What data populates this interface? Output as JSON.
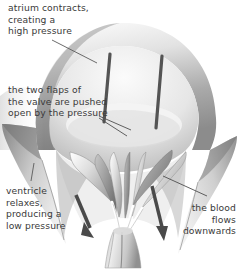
{
  "figure": {
    "style": "grayscale anatomical illustration",
    "width": 239,
    "height": 270,
    "background_color": "#ffffff",
    "text_color": "#3a3a3a"
  },
  "labels": {
    "atrium": "atrium contracts,\ncreating a\nhigh pressure",
    "flaps": "the two flaps of\nthe valve are pushed\nopen by the pressure",
    "ventricle": "ventricle\nrelaxes,\nproducing a\nlow pressure",
    "blood": "the blood\nflows\ndownwards"
  },
  "annotations": {
    "leader_lines": [
      {
        "name": "leader-atrium",
        "from": [
          52,
          40
        ],
        "to": [
          96,
          62
        ]
      },
      {
        "name": "leader-flaps-upper",
        "from": [
          100,
          117
        ],
        "to": [
          129,
          130
        ]
      },
      {
        "name": "leader-flaps-lower",
        "from": [
          100,
          119
        ],
        "to": [
          126,
          135
        ]
      },
      {
        "name": "leader-ventricle",
        "from": [
          33,
          165
        ],
        "to": [
          30,
          180
        ]
      },
      {
        "name": "leader-blood",
        "from": [
          206,
          196
        ],
        "to": [
          163,
          177
        ]
      }
    ],
    "arrows": [
      {
        "name": "arrow-blood-left",
        "from": [
          77,
          196
        ],
        "to": [
          93,
          235
        ],
        "direction": "down-right"
      },
      {
        "name": "arrow-blood-right",
        "from": [
          152,
          186
        ],
        "to": [
          164,
          238
        ],
        "direction": "down"
      }
    ]
  },
  "anatomy": {
    "parts": [
      {
        "name": "atrium-chamber",
        "label": "atrium"
      },
      {
        "name": "atrium-wall",
        "label": "atrium wall"
      },
      {
        "name": "valve-flap-left",
        "label": "valve flap"
      },
      {
        "name": "valve-flap-right",
        "label": "valve flap"
      },
      {
        "name": "chordae-tendineae",
        "label": "chordae tendineae"
      },
      {
        "name": "papillary-muscle",
        "label": "papillary muscle"
      },
      {
        "name": "ventricle-wall-left",
        "label": "ventricle wall"
      },
      {
        "name": "ventricle-wall-right",
        "label": "ventricle wall"
      },
      {
        "name": "atrial-strut-left",
        "label": "strut"
      },
      {
        "name": "atrial-strut-right",
        "label": "strut"
      }
    ]
  },
  "colors": {
    "ink": "#3a3a3a",
    "dark_tissue": "#5a5a5a",
    "mid_tissue": "#9a9a9a",
    "light_tissue": "#d8d8d8",
    "pale_tissue": "#f0f0f0",
    "shadow": "#2e2e2e"
  }
}
